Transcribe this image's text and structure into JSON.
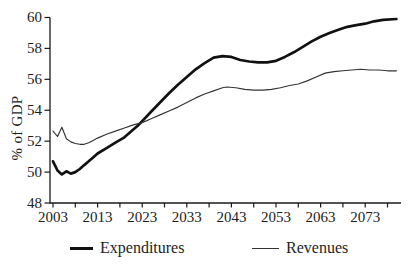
{
  "chart_data": {
    "type": "line",
    "title": "",
    "xlabel": "",
    "ylabel": "% of GDP",
    "grid": false,
    "legend_position": "bottom",
    "ylim": [
      48,
      60
    ],
    "xlim": [
      2003,
      2081
    ],
    "yticks": [
      48,
      50,
      52,
      54,
      56,
      58,
      60
    ],
    "xticks_labeled": [
      2003,
      2013,
      2023,
      2033,
      2043,
      2053,
      2063,
      2073
    ],
    "xticks_minor": [
      2003,
      2008,
      2013,
      2018,
      2023,
      2028,
      2033,
      2038,
      2043,
      2048,
      2053,
      2058,
      2063,
      2068,
      2073,
      2078
    ],
    "axis_color": "#1a1a1a",
    "series": [
      {
        "name": "Expenditures",
        "color": "#111111",
        "stroke_width": 2.7,
        "points": [
          [
            2003,
            50.7
          ],
          [
            2004,
            50.1
          ],
          [
            2005,
            49.85
          ],
          [
            2006,
            50.05
          ],
          [
            2007,
            49.9
          ],
          [
            2008,
            50.0
          ],
          [
            2009,
            50.2
          ],
          [
            2010,
            50.45
          ],
          [
            2011,
            50.7
          ],
          [
            2012,
            50.95
          ],
          [
            2013,
            51.2
          ],
          [
            2015,
            51.55
          ],
          [
            2017,
            51.9
          ],
          [
            2019,
            52.25
          ],
          [
            2021,
            52.75
          ],
          [
            2022,
            53.0
          ],
          [
            2023,
            53.3
          ],
          [
            2025,
            53.9
          ],
          [
            2027,
            54.5
          ],
          [
            2029,
            55.1
          ],
          [
            2031,
            55.65
          ],
          [
            2033,
            56.15
          ],
          [
            2035,
            56.65
          ],
          [
            2037,
            57.05
          ],
          [
            2039,
            57.4
          ],
          [
            2041,
            57.5
          ],
          [
            2043,
            57.45
          ],
          [
            2045,
            57.25
          ],
          [
            2047,
            57.15
          ],
          [
            2049,
            57.1
          ],
          [
            2051,
            57.1
          ],
          [
            2053,
            57.2
          ],
          [
            2055,
            57.45
          ],
          [
            2057,
            57.75
          ],
          [
            2059,
            58.1
          ],
          [
            2061,
            58.45
          ],
          [
            2063,
            58.75
          ],
          [
            2065,
            59.0
          ],
          [
            2067,
            59.2
          ],
          [
            2069,
            59.4
          ],
          [
            2071,
            59.5
          ],
          [
            2073,
            59.6
          ],
          [
            2075,
            59.75
          ],
          [
            2077,
            59.85
          ],
          [
            2080,
            59.9
          ]
        ]
      },
      {
        "name": "Revenues",
        "color": "#333333",
        "stroke_width": 1.15,
        "points": [
          [
            2003,
            52.65
          ],
          [
            2004,
            52.3
          ],
          [
            2005,
            52.9
          ],
          [
            2006,
            52.15
          ],
          [
            2007,
            51.95
          ],
          [
            2008,
            51.85
          ],
          [
            2009,
            51.8
          ],
          [
            2010,
            51.8
          ],
          [
            2011,
            51.9
          ],
          [
            2012,
            52.05
          ],
          [
            2013,
            52.2
          ],
          [
            2015,
            52.45
          ],
          [
            2017,
            52.65
          ],
          [
            2019,
            52.85
          ],
          [
            2021,
            53.05
          ],
          [
            2023,
            53.2
          ],
          [
            2025,
            53.45
          ],
          [
            2027,
            53.7
          ],
          [
            2029,
            53.95
          ],
          [
            2031,
            54.2
          ],
          [
            2033,
            54.5
          ],
          [
            2035,
            54.8
          ],
          [
            2037,
            55.05
          ],
          [
            2039,
            55.25
          ],
          [
            2041,
            55.45
          ],
          [
            2042,
            55.5
          ],
          [
            2044,
            55.45
          ],
          [
            2046,
            55.35
          ],
          [
            2048,
            55.3
          ],
          [
            2050,
            55.3
          ],
          [
            2052,
            55.35
          ],
          [
            2054,
            55.45
          ],
          [
            2056,
            55.6
          ],
          [
            2058,
            55.7
          ],
          [
            2060,
            55.9
          ],
          [
            2062,
            56.15
          ],
          [
            2064,
            56.4
          ],
          [
            2066,
            56.5
          ],
          [
            2068,
            56.55
          ],
          [
            2070,
            56.6
          ],
          [
            2072,
            56.65
          ],
          [
            2074,
            56.6
          ],
          [
            2076,
            56.6
          ],
          [
            2078,
            56.55
          ],
          [
            2080,
            56.55
          ]
        ]
      }
    ]
  }
}
